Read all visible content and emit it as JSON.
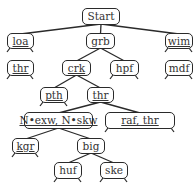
{
  "diagram": {
    "type": "tree",
    "nodes": [
      {
        "id": "start",
        "label": "Start",
        "underlined": false,
        "x": 82,
        "y": 8,
        "w": 38,
        "h": 17,
        "legs": false
      },
      {
        "id": "loa",
        "label": "loa",
        "underlined": true,
        "x": 7,
        "y": 33,
        "w": 27,
        "h": 16,
        "legs": true
      },
      {
        "id": "grb",
        "label": "grb",
        "underlined": false,
        "x": 86,
        "y": 33,
        "w": 29,
        "h": 16,
        "legs": false
      },
      {
        "id": "wim",
        "label": "wim",
        "underlined": true,
        "x": 165,
        "y": 33,
        "w": 28,
        "h": 16,
        "legs": true
      },
      {
        "id": "thr1",
        "label": "thr",
        "underlined": true,
        "x": 7,
        "y": 60,
        "w": 27,
        "h": 16,
        "legs": true
      },
      {
        "id": "crk",
        "label": "crk",
        "underlined": true,
        "x": 62,
        "y": 60,
        "w": 29,
        "h": 16,
        "legs": false
      },
      {
        "id": "hpf",
        "label": "hpf",
        "underlined": false,
        "x": 110,
        "y": 60,
        "w": 29,
        "h": 16,
        "legs": true
      },
      {
        "id": "mdf",
        "label": "mdf",
        "underlined": false,
        "x": 165,
        "y": 60,
        "w": 28,
        "h": 16,
        "legs": true
      },
      {
        "id": "pth",
        "label": "pth",
        "underlined": true,
        "x": 40,
        "y": 87,
        "w": 28,
        "h": 16,
        "legs": true
      },
      {
        "id": "thr2",
        "label": "thr",
        "underlined": true,
        "x": 87,
        "y": 87,
        "w": 27,
        "h": 16,
        "legs": false
      },
      {
        "id": "nexw",
        "label": "N•exw, N•skw",
        "underlined": true,
        "x": 24,
        "y": 112,
        "w": 69,
        "h": 17,
        "legs": false
      },
      {
        "id": "rafthr",
        "label": "raf, thr",
        "underlined": true,
        "x": 105,
        "y": 112,
        "w": 70,
        "h": 17,
        "legs": true
      },
      {
        "id": "kgr",
        "label": "kgr",
        "underlined": true,
        "x": 12,
        "y": 138,
        "w": 27,
        "h": 16,
        "legs": true
      },
      {
        "id": "big",
        "label": "big",
        "underlined": false,
        "x": 77,
        "y": 138,
        "w": 28,
        "h": 16,
        "legs": false
      },
      {
        "id": "huf",
        "label": "huf",
        "underlined": false,
        "x": 54,
        "y": 162,
        "w": 28,
        "h": 17,
        "legs": true
      },
      {
        "id": "ske",
        "label": "ske",
        "underlined": false,
        "x": 100,
        "y": 162,
        "w": 28,
        "h": 17,
        "legs": true
      }
    ],
    "edges": [
      [
        "start",
        "loa"
      ],
      [
        "start",
        "grb"
      ],
      [
        "start",
        "wim"
      ],
      [
        "grb",
        "crk"
      ],
      [
        "grb",
        "hpf"
      ],
      [
        "crk",
        "pth"
      ],
      [
        "crk",
        "thr2"
      ],
      [
        "thr2",
        "nexw"
      ],
      [
        "thr2",
        "rafthr"
      ],
      [
        "nexw",
        "kgr"
      ],
      [
        "nexw",
        "big"
      ],
      [
        "big",
        "huf"
      ],
      [
        "big",
        "ske"
      ]
    ],
    "colors": {
      "stroke": "#2a2a2a",
      "text": "#333333",
      "background": "#ffffff"
    }
  }
}
